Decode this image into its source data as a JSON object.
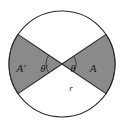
{
  "figure": {
    "type": "geometry-diagram",
    "background_color": "#ffffff",
    "circle": {
      "name": "outer-circle",
      "center_x": 62,
      "center_y": 64,
      "radius": 53,
      "stroke_color": "#2b2b2b",
      "fill_color": "#ffffff",
      "stroke_width": 1
    },
    "sectors": [
      {
        "name": "sector-A",
        "label": "A",
        "angle_label": "θ",
        "side": "right",
        "fill_color": "#8a8a8a",
        "stroke_color": "#2b2b2b",
        "start_angle_deg": -34,
        "end_angle_deg": 34
      },
      {
        "name": "sector-A-prime",
        "label": "A′",
        "angle_label": "θ′",
        "side": "left",
        "fill_color": "#8a8a8a",
        "stroke_color": "#2b2b2b",
        "start_angle_deg": 146,
        "end_angle_deg": 214
      }
    ],
    "labels": {
      "area_right": "A",
      "area_left": "A′",
      "angle_right": "θ",
      "angle_left": "θ′",
      "radius": "r"
    },
    "label_positions": {
      "area_right_x": 93,
      "area_right_y": 69,
      "area_left_x": 20,
      "area_left_y": 69,
      "angle_right_x": 72,
      "angle_right_y": 69,
      "angle_left_x": 44,
      "angle_left_y": 69,
      "radius_x": 71,
      "radius_y": 89
    },
    "angle_arcs": [
      {
        "name": "angle-arc-theta",
        "radius": 14,
        "stroke_color": "#3a3a3a"
      },
      {
        "name": "angle-arc-theta-prime",
        "radius": 16,
        "stroke_color": "#3a3a3a"
      }
    ],
    "radius_line": {
      "name": "radius-segment",
      "from_x": 62,
      "from_y": 64,
      "to_x": 86,
      "to_y": 111
    }
  }
}
